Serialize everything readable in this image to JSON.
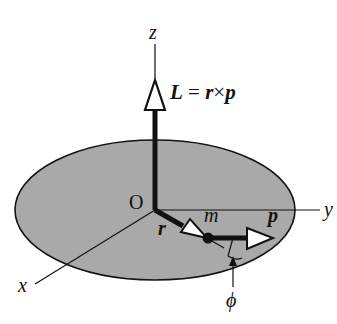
{
  "diagram": {
    "colors": {
      "disk_fill": "#a9a9a9",
      "line": "#111111",
      "background": "#ffffff"
    },
    "axes": {
      "z_label": "z",
      "y_label": "y",
      "x_label": "x",
      "origin_label": "O"
    },
    "vectors": {
      "L_label": "L",
      "equation_eq": " = ",
      "equation_r": "r",
      "equation_times": "×",
      "equation_p": "p",
      "r_label": "r",
      "p_label": "p"
    },
    "particle": {
      "mass_label": "m"
    },
    "angle": {
      "phi_label": "ϕ"
    }
  }
}
